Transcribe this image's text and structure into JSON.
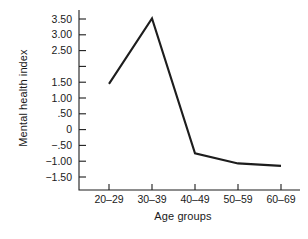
{
  "chart_data": {
    "type": "line",
    "title": "",
    "xlabel": "Age groups",
    "ylabel": "Mental health index",
    "categories": [
      "20–29",
      "30–39",
      "40–49",
      "50–59",
      "60–69"
    ],
    "values": [
      1.45,
      3.52,
      -0.75,
      -1.07,
      -1.15
    ],
    "series": [
      {
        "name": "Mental health index",
        "values": [
          1.45,
          3.52,
          -0.75,
          -1.07,
          -1.15
        ]
      }
    ],
    "ylim": [
      -1.5,
      3.5
    ],
    "ytick_values": [
      3.5,
      3.0,
      2.5,
      2.0,
      1.5,
      1.0,
      0.5,
      0.0,
      -0.5,
      -1.0,
      -1.5
    ],
    "ytick_labels": [
      "3.50",
      "3.00",
      "2.50",
      "",
      "1.50",
      "1.00",
      ".50",
      "0",
      "−.50",
      "−1.00",
      "−1.50"
    ],
    "grid": false,
    "legend": "none",
    "line_color": "#1d1d1d",
    "axis_color": "#1d1d1d",
    "background_color": "#ffffff"
  }
}
